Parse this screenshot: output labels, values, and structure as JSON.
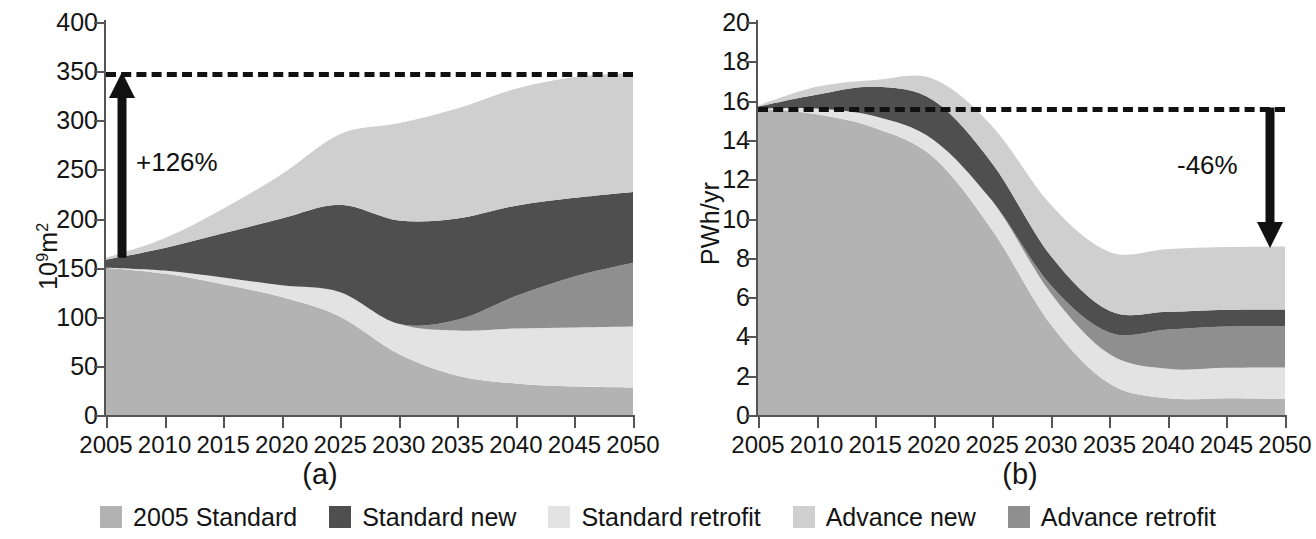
{
  "figure": {
    "panels": [
      {
        "caption": "(a)",
        "ylabel_prefix": "10",
        "ylabel_exp": "9",
        "ylabel_suffix": "m",
        "ylabel_suffix_exp": "2",
        "annotation": "+126%",
        "dashed_reference_value": 349
      },
      {
        "caption": "(b)",
        "ylabel": "PWh/yr",
        "annotation": "-46%",
        "dashed_reference_value": 15.65
      }
    ]
  },
  "legend": {
    "position": "bottom-center",
    "items": [
      {
        "label": "2005 Standard",
        "color": "#b3b3b3"
      },
      {
        "label": "Standard new",
        "color": "#4f4f4f"
      },
      {
        "label": "Standard retrofit",
        "color": "#e3e3e3"
      },
      {
        "label": "Advance new",
        "color": "#cfcfcf"
      },
      {
        "label": "Advance retrofit",
        "color": "#8f8f8f"
      }
    ]
  },
  "chart_data": [
    {
      "type": "area",
      "stacked": true,
      "title": "(a)",
      "xlabel": "",
      "ylabel": "10^9 m^2",
      "x": [
        2005,
        2010,
        2015,
        2020,
        2025,
        2030,
        2035,
        2040,
        2045,
        2050
      ],
      "xticklabels": [
        "2005",
        "2010",
        "2015",
        "2020",
        "2025",
        "2030",
        "2035",
        "2040",
        "2045",
        "2050"
      ],
      "xlim": [
        2005,
        2050
      ],
      "ylim": [
        0,
        400
      ],
      "yticks": [
        0,
        50,
        100,
        150,
        200,
        250,
        300,
        350,
        400
      ],
      "yticklabels": [
        "0",
        "50",
        "100",
        "150",
        "200",
        "250",
        "300",
        "350",
        "400"
      ],
      "grid": false,
      "series": [
        {
          "name": "2005 Standard",
          "color": "#b3b3b3",
          "values": [
            150,
            144,
            133,
            120,
            100,
            62,
            40,
            32,
            29,
            28
          ]
        },
        {
          "name": "Standard retrofit",
          "color": "#e3e3e3",
          "values": [
            0,
            3,
            7,
            12,
            25,
            31,
            46,
            56,
            60,
            62
          ]
        },
        {
          "name": "Advance retrofit",
          "color": "#8f8f8f",
          "values": [
            0,
            0,
            0,
            0,
            0,
            0,
            11,
            33,
            52,
            65
          ]
        },
        {
          "name": "Standard new",
          "color": "#4f4f4f",
          "values": [
            8,
            23,
            45,
            68,
            89,
            105,
            103,
            92,
            80,
            72
          ]
        },
        {
          "name": "Advance new",
          "color": "#cfcfcf",
          "values": [
            2,
            10,
            25,
            45,
            72,
            99,
            112,
            119,
            123,
            121
          ]
        }
      ],
      "totals": [
        160,
        180,
        210,
        245,
        286,
        297,
        312,
        332,
        344,
        348
      ],
      "annotations": [
        {
          "text": "+126%",
          "type": "arrow-up",
          "from": 160,
          "to": 349
        }
      ],
      "reference_line": {
        "value": 349,
        "style": "dashed"
      }
    },
    {
      "type": "area",
      "stacked": true,
      "title": "(b)",
      "xlabel": "",
      "ylabel": "PWh/yr",
      "x": [
        2005,
        2010,
        2015,
        2020,
        2025,
        2030,
        2035,
        2040,
        2045,
        2050
      ],
      "xticklabels": [
        "2005",
        "2010",
        "2015",
        "2020",
        "2025",
        "2030",
        "2035",
        "2040",
        "2045",
        "2050"
      ],
      "xlim": [
        2005,
        2050
      ],
      "ylim": [
        0,
        20
      ],
      "yticks": [
        0,
        2,
        4,
        6,
        8,
        10,
        12,
        14,
        16,
        18,
        20
      ],
      "yticklabels": [
        "0",
        "2",
        "4",
        "6",
        "8",
        "10",
        "12",
        "14",
        "16",
        "18",
        "20"
      ],
      "grid": false,
      "series": [
        {
          "name": "2005 Standard",
          "color": "#b3b3b3",
          "values": [
            15.6,
            15.3,
            14.6,
            13.1,
            9.4,
            4.6,
            1.6,
            0.85,
            0.85,
            0.82
          ]
        },
        {
          "name": "Standard retrofit",
          "color": "#e3e3e3",
          "values": [
            0,
            0.3,
            0.6,
            0.9,
            1.5,
            1.6,
            1.5,
            1.5,
            1.55,
            1.6
          ]
        },
        {
          "name": "Advance retrofit",
          "color": "#8f8f8f",
          "values": [
            0,
            0,
            0,
            0,
            0,
            0.4,
            1.1,
            2.0,
            2.1,
            2.1
          ]
        },
        {
          "name": "Standard new",
          "color": "#4f4f4f",
          "values": [
            0.1,
            0.7,
            1.5,
            2.0,
            1.9,
            1.5,
            1.1,
            0.9,
            0.85,
            0.85
          ]
        },
        {
          "name": "Advance new",
          "color": "#cfcfcf",
          "values": [
            0.05,
            0.4,
            0.35,
            1.1,
            1.9,
            2.6,
            3.0,
            3.2,
            3.2,
            3.2
          ]
        }
      ],
      "totals": [
        15.75,
        16.7,
        17.05,
        17.1,
        14.7,
        10.7,
        8.3,
        8.45,
        8.55,
        8.57
      ],
      "annotations": [
        {
          "text": "-46%",
          "type": "arrow-down",
          "from": 15.65,
          "to": 8.5
        }
      ],
      "reference_line": {
        "value": 15.65,
        "style": "dashed"
      }
    }
  ]
}
